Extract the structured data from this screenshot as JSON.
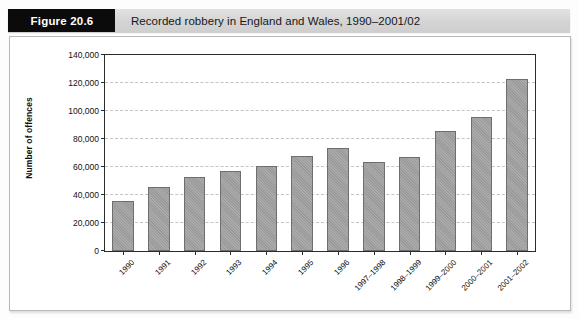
{
  "figure": {
    "tag": "Figure 20.6",
    "caption": "Recorded robbery in England and Wales, 1990–2001/02"
  },
  "chart_data": {
    "type": "bar",
    "title": "Recorded robbery in England and Wales, 1990–2001/02",
    "xlabel": "",
    "ylabel": "Number of offences",
    "categories": [
      "1990",
      "1991",
      "1992",
      "1993",
      "1994",
      "1995",
      "1996",
      "1997–1998",
      "1998–1999",
      "1999–2000",
      "2000–2001",
      "2001–2002"
    ],
    "values": [
      36000,
      45500,
      53000,
      57500,
      60500,
      68000,
      73500,
      63500,
      67000,
      86000,
      96000,
      123000
    ],
    "ylim": [
      0,
      140000
    ],
    "ytick_values": [
      0,
      20000,
      40000,
      60000,
      80000,
      100000,
      120000,
      140000
    ],
    "ytick_labels": [
      "0",
      "20,000",
      "40,000",
      "60,000",
      "80,000",
      "100,000",
      "120,000",
      "140,000"
    ],
    "grid": true,
    "legend": null,
    "legend_position": "none",
    "bar_color": "#9a9a9a",
    "bar_border_color": "#6e6e6e",
    "axis_color": "#2b2b2b",
    "grid_color": "#c3c3c3"
  }
}
